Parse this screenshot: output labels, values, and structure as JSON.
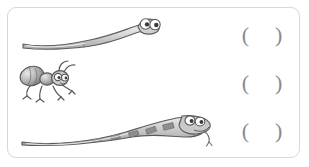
{
  "page": {
    "type": "worksheet",
    "background_color": "#ffffff",
    "frame_border_color": "#d8d8d8"
  },
  "answer_format": {
    "open_paren": "(",
    "close_paren": ")",
    "value": "",
    "color": "#8a8a8a"
  },
  "rows": [
    {
      "id": "worm",
      "figure_name": "worm-illustration",
      "label": "worm",
      "answer": {
        "open_paren": "(",
        "close_paren": ")",
        "value": ""
      }
    },
    {
      "id": "ant",
      "figure_name": "ant-illustration",
      "label": "ant",
      "answer": {
        "open_paren": "(",
        "close_paren": ")",
        "value": ""
      }
    },
    {
      "id": "snake",
      "figure_name": "snake-illustration",
      "label": "snake",
      "answer": {
        "open_paren": "(",
        "close_paren": ")",
        "value": ""
      }
    }
  ],
  "colors": {
    "outline": "#5a5a5a",
    "body_light": "#e2e2e2",
    "body_mid": "#bdbdbd",
    "body_dark": "#9a9a9a",
    "eye_white": "#ffffff",
    "pupil": "#3a3a3a"
  }
}
